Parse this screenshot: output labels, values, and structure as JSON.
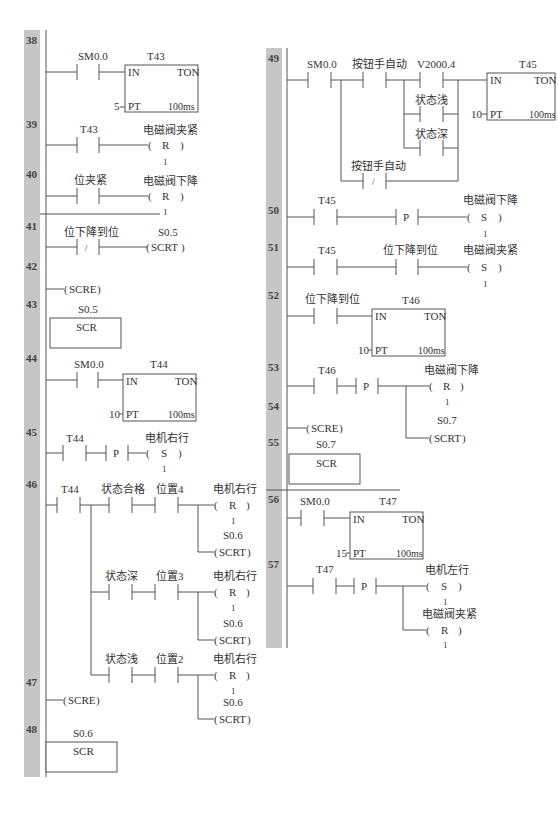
{
  "colors": {
    "rail_bar": "#c6c6c6",
    "line": "#555555",
    "text": "#333333"
  },
  "left_column": {
    "networks": [
      {
        "num": "38",
        "contact": "SM0.0",
        "timer": {
          "name": "T43",
          "type": "TON",
          "in": "IN",
          "pt": "PT",
          "pt_value": "5",
          "base": "100ms"
        }
      },
      {
        "num": "39",
        "contact": "T43",
        "coil": {
          "addr": "电磁阀夹紧",
          "op": "R",
          "n": "1"
        }
      },
      {
        "num": "40",
        "contact": "位夹紧",
        "coil": {
          "addr": "电磁阀下降",
          "op": "R",
          "n": "1"
        }
      },
      {
        "num": "41",
        "contact": "位下降到位",
        "contact_type": "/",
        "coil": {
          "addr": "S0.5",
          "op": "SCRT"
        }
      },
      {
        "num": "42",
        "coil": {
          "op": "SCRE"
        }
      },
      {
        "num": "43",
        "scr": {
          "addr": "S0.5",
          "label": "SCR"
        }
      },
      {
        "num": "44",
        "contact": "SM0.0",
        "timer": {
          "name": "T44",
          "type": "TON",
          "in": "IN",
          "pt": "PT",
          "pt_value": "10",
          "base": "100ms"
        }
      },
      {
        "num": "45",
        "contact": "T44",
        "edge": "P",
        "coil": {
          "addr": "电机右行",
          "op": "S",
          "n": "1"
        }
      },
      {
        "num": "46",
        "contact": "T44",
        "branches": [
          {
            "c1": "状态合格",
            "c2": "位置4",
            "coil1": {
              "addr": "电机右行",
              "op": "R",
              "n": "1"
            },
            "coil2": {
              "addr": "S0.6",
              "op": "SCRT"
            }
          },
          {
            "c1": "状态深",
            "c2": "位置3",
            "coil1": {
              "addr": "电机右行",
              "op": "R",
              "n": "1"
            },
            "coil2": {
              "addr": "S0.6",
              "op": "SCRT"
            }
          },
          {
            "c1": "状态浅",
            "c2": "位置2",
            "coil1": {
              "addr": "电机右行",
              "op": "R",
              "n": "1"
            },
            "coil2": {
              "addr": "S0.6",
              "op": "SCRT"
            }
          }
        ]
      },
      {
        "num": "47",
        "coil": {
          "op": "SCRE"
        }
      },
      {
        "num": "48",
        "scr": {
          "addr": "S0.6",
          "label": "SCR"
        }
      }
    ]
  },
  "right_column": {
    "networks": [
      {
        "num": "49",
        "c1": "SM0.0",
        "c2": "按钮手自动",
        "c3": "V2000.4",
        "p1": "状态浅",
        "p2": "状态深",
        "nc": "按钮手自动",
        "nc_type": "/",
        "timer": {
          "name": "T45",
          "type": "TON",
          "in": "IN",
          "pt": "PT",
          "pt_value": "10",
          "base": "100ms"
        }
      },
      {
        "num": "50",
        "contact": "T45",
        "edge": "P",
        "coil": {
          "addr": "电磁阀下降",
          "op": "S",
          "n": "1"
        }
      },
      {
        "num": "51",
        "contact": "T45",
        "c2": "位下降到位",
        "coil": {
          "addr": "电磁阀夹紧",
          "op": "S",
          "n": "1"
        }
      },
      {
        "num": "52",
        "contact": "位下降到位",
        "timer": {
          "name": "T46",
          "type": "TON",
          "in": "IN",
          "pt": "PT",
          "pt_value": "10",
          "base": "100ms"
        }
      },
      {
        "num": "53",
        "contact": "T46",
        "edge": "P",
        "coil1": {
          "addr": "电磁阀下降",
          "op": "R",
          "n": "1"
        },
        "coil2": {
          "addr": "S0.7",
          "op": "SCRT"
        }
      },
      {
        "num": "54",
        "coil": {
          "op": "SCRE"
        }
      },
      {
        "num": "55",
        "scr": {
          "addr": "S0.7",
          "label": "SCR"
        }
      },
      {
        "num": "56",
        "contact": "SM0.0",
        "timer": {
          "name": "T47",
          "type": "TON",
          "in": "IN",
          "pt": "PT",
          "pt_value": "15",
          "base": "100ms"
        }
      },
      {
        "num": "57",
        "contact": "T47",
        "edge": "P",
        "coil1": {
          "addr": "电机左行",
          "op": "S",
          "n": "1"
        },
        "coil2": {
          "addr": "电磁阀夹紧",
          "op": "R",
          "n": "1"
        }
      }
    ]
  }
}
